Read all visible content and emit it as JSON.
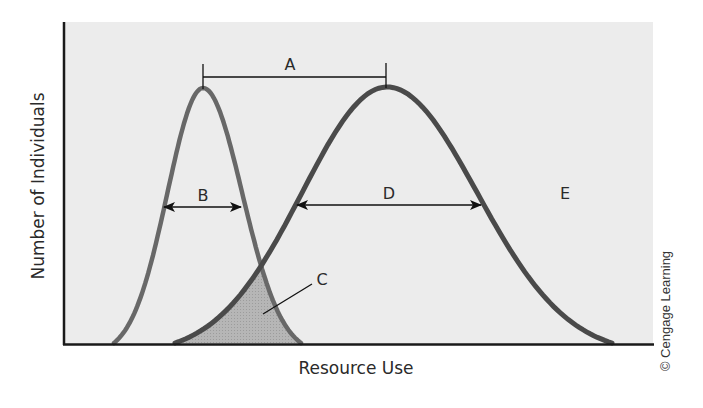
{
  "figure": {
    "x_axis_label": "Resource Use",
    "y_axis_label": "Number of Individuals",
    "credit": "© Cengage Learning",
    "colors": {
      "background": "#ffffff",
      "plot_background": "#ececec",
      "axis": "#1a1a1a",
      "narrow_curve": "#686868",
      "wide_curve": "#4a4a4a",
      "overlap_fill": "#b3b3b3",
      "annotation": "#111111"
    },
    "annotations": {
      "A": "A",
      "B": "B",
      "C": "C",
      "D": "D",
      "E": "E"
    }
  },
  "chart_data": {
    "type": "area",
    "title": "",
    "xlabel": "Resource Use",
    "ylabel": "Number of Individuals",
    "grid": false,
    "legend": null,
    "series": [
      {
        "name": "Narrow niche species (curve with B width)",
        "shape": "bell",
        "peak_x_px": 203,
        "peak_y_px": 88,
        "base_left_px": 114,
        "base_right_px": 301,
        "color": "#686868"
      },
      {
        "name": "Broad niche species (curve with D width)",
        "shape": "bell",
        "peak_x_px": 387,
        "peak_y_px": 87,
        "base_left_px": 175,
        "base_right_px": 612,
        "color": "#4a4a4a"
      }
    ],
    "annotations": [
      {
        "label": "A",
        "meaning": "distance between the peaks of the two curves",
        "from_x_px": 203,
        "to_x_px": 386,
        "y_px": 77
      },
      {
        "label": "B",
        "meaning": "width of narrow curve",
        "from_x_px": 163,
        "to_x_px": 241,
        "y_px": 207
      },
      {
        "label": "C",
        "meaning": "overlap region between curves (shaded)",
        "x_px": 322,
        "y_px": 279
      },
      {
        "label": "D",
        "meaning": "width of broad curve",
        "from_x_px": 296,
        "to_x_px": 481,
        "y_px": 205
      },
      {
        "label": "E",
        "meaning": "region of unused resource",
        "x_px": 565,
        "y_px": 193
      }
    ],
    "plot_area_px": {
      "left": 63,
      "top": 22,
      "right": 653,
      "bottom": 344
    }
  }
}
